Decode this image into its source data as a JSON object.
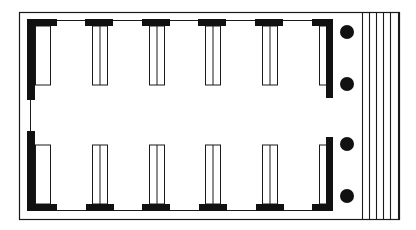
{
  "diagram": {
    "type": "architectural-floor-plan",
    "colors": {
      "background": "#ffffff",
      "line": "#1a1a1a",
      "fill": "#111111"
    },
    "outer_border": {
      "x": 19,
      "y": 12,
      "w": 380,
      "h": 207
    },
    "walls": [
      {
        "name": "left-wall-top",
        "x": 27,
        "y": 20,
        "w": 8,
        "h": 80
      },
      {
        "name": "left-wall-bottom",
        "x": 27,
        "y": 131,
        "w": 8,
        "h": 80
      },
      {
        "name": "right-wall-top",
        "x": 326,
        "y": 20,
        "w": 7,
        "h": 78
      },
      {
        "name": "right-wall-bottom",
        "x": 326,
        "y": 137,
        "w": 7,
        "h": 74
      }
    ],
    "top_piers": [
      {
        "x": 27,
        "w": 30
      },
      {
        "x": 85,
        "w": 28
      },
      {
        "x": 142,
        "w": 28
      },
      {
        "x": 198,
        "w": 28
      },
      {
        "x": 255,
        "w": 28
      },
      {
        "x": 312,
        "w": 21
      }
    ],
    "bottom_piers": [
      {
        "x": 27,
        "w": 30
      },
      {
        "x": 86,
        "w": 28
      },
      {
        "x": 142,
        "w": 28
      },
      {
        "x": 199,
        "w": 28
      },
      {
        "x": 256,
        "w": 28
      },
      {
        "x": 312,
        "w": 21
      }
    ],
    "top_pilasters": [
      {
        "x": 35,
        "w": 15,
        "divided": false
      },
      {
        "x": 92,
        "w": 15,
        "divided": true
      },
      {
        "x": 149,
        "w": 15,
        "divided": true
      },
      {
        "x": 205,
        "w": 15,
        "divided": true
      },
      {
        "x": 262,
        "w": 15,
        "divided": true
      },
      {
        "x": 319,
        "w": 8,
        "divided": false
      }
    ],
    "bottom_pilasters": [
      {
        "x": 35,
        "w": 15,
        "divided": false
      },
      {
        "x": 92,
        "w": 15,
        "divided": true
      },
      {
        "x": 149,
        "w": 15,
        "divided": true
      },
      {
        "x": 205,
        "w": 15,
        "divided": true
      },
      {
        "x": 262,
        "w": 15,
        "divided": true
      },
      {
        "x": 319,
        "w": 8,
        "divided": false
      }
    ],
    "columns": [
      {
        "cx": 347,
        "cy": 32,
        "r": 7
      },
      {
        "cx": 347,
        "cy": 84,
        "r": 7
      },
      {
        "cx": 347,
        "cy": 144,
        "r": 7
      },
      {
        "cx": 347,
        "cy": 196,
        "r": 7
      }
    ],
    "steps": {
      "x_lines": [
        362,
        369,
        376,
        383,
        390,
        398
      ],
      "y_top": 12,
      "y_bottom": 219
    }
  }
}
